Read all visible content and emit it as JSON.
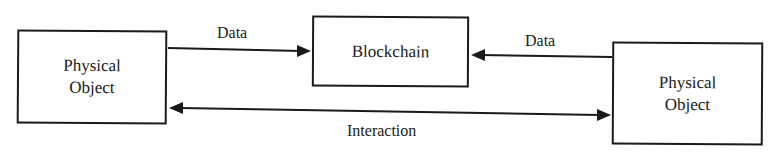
{
  "diagram": {
    "nodes": {
      "left": {
        "label": "Physical\nObject"
      },
      "center": {
        "label": "Blockchain"
      },
      "right": {
        "label": "Physical\nObject"
      }
    },
    "edges": {
      "left_to_center": {
        "label": "Data",
        "direction": "Physical Object (left) -> Blockchain"
      },
      "right_to_center": {
        "label": "Data",
        "direction": "Physical Object (right) -> Blockchain"
      },
      "interaction": {
        "label": "Interaction",
        "direction": "bidirectional between Physical Objects"
      }
    },
    "colors": {
      "stroke": "#1a1a1a",
      "background": "#ffffff"
    }
  }
}
